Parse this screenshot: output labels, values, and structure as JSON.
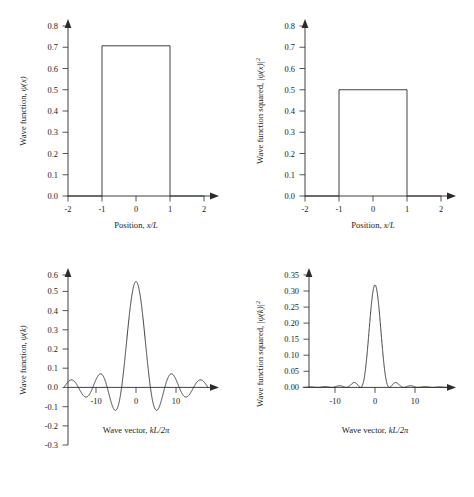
{
  "figure": {
    "panels": [
      {
        "id": "top-left",
        "name": "wave-function-position",
        "ylabel_plain": "Wave function, ",
        "ylabel_math": "ψ(x)",
        "ylabel_sup": "",
        "xlabel_plain": "Position, ",
        "xlabel_math": "x/L",
        "yticks": [
          "0.0",
          "0.1",
          "0.2",
          "0.3",
          "0.4",
          "0.5",
          "0.6",
          "0.7",
          "0.8"
        ],
        "xticks": [
          "-2",
          "-1",
          "0",
          "1",
          "2"
        ]
      },
      {
        "id": "top-right",
        "name": "wave-function-squared-position",
        "ylabel_plain": "Wave function squared, ",
        "ylabel_math": "|ψ(x)|",
        "ylabel_sup": "2",
        "xlabel_plain": "Position, ",
        "xlabel_math": "x/L",
        "yticks": [
          "0.0",
          "0.1",
          "0.2",
          "0.3",
          "0.4",
          "0.5",
          "0.6",
          "0.7",
          "0.8"
        ],
        "xticks": [
          "-2",
          "-1",
          "0",
          "1",
          "2"
        ]
      },
      {
        "id": "bottom-left",
        "name": "wave-function-wavevector",
        "ylabel_plain": "Wave function, ",
        "ylabel_math": "ψ(k)",
        "ylabel_sup": "",
        "xlabel_plain": "Wave vector, ",
        "xlabel_math": "kL/2π",
        "yticks": [
          "-0.3",
          "-0.2",
          "-0.1",
          "0.0",
          "0.1",
          "0.2",
          "0.3",
          "0.4",
          "0.5",
          "0.6"
        ],
        "xticks": [
          "-10",
          "0",
          "10"
        ]
      },
      {
        "id": "bottom-right",
        "name": "wave-function-squared-wavevector",
        "ylabel_plain": "Wave function squared, ",
        "ylabel_math": "|ψ(k)|",
        "ylabel_sup": "2",
        "xlabel_plain": "Wave vector, ",
        "xlabel_math": "kL/2π",
        "yticks": [
          "0.00",
          "0.05",
          "0.10",
          "0.15",
          "0.20",
          "0.25",
          "0.30",
          "0.35"
        ],
        "xticks": [
          "-10",
          "0",
          "10"
        ]
      }
    ]
  },
  "chart_data": [
    {
      "type": "line",
      "id": "top-left",
      "title": "",
      "xlabel": "Position, x/L",
      "ylabel": "Wave function, ψ(x)",
      "xlim": [
        -2,
        2
      ],
      "ylim": [
        0.0,
        0.8
      ],
      "xticks": [
        -2,
        -1,
        0,
        1,
        2
      ],
      "yticks": [
        0.0,
        0.1,
        0.2,
        0.3,
        0.4,
        0.5,
        0.6,
        0.7,
        0.8
      ],
      "grid": false,
      "legend": null,
      "description": "Rectangular top-hat wave function of amplitude 1/sqrt(2) between x/L = -1 and x/L = 1, zero elsewhere",
      "amplitude": 0.707,
      "edges": [
        -1,
        1
      ],
      "x": [
        -2,
        -1,
        -1,
        1,
        1,
        2
      ],
      "y": [
        0,
        0,
        0.707,
        0.707,
        0,
        0
      ]
    },
    {
      "type": "line",
      "id": "top-right",
      "title": "",
      "xlabel": "Position, x/L",
      "ylabel": "Wave function squared, |ψ(x)|²",
      "xlim": [
        -2,
        2
      ],
      "ylim": [
        0.0,
        0.8
      ],
      "xticks": [
        -2,
        -1,
        0,
        1,
        2
      ],
      "yticks": [
        0.0,
        0.1,
        0.2,
        0.3,
        0.4,
        0.5,
        0.6,
        0.7,
        0.8
      ],
      "grid": false,
      "legend": null,
      "description": "Square of the top-hat: constant probability density 0.5 between x/L = -1 and x/L = 1",
      "amplitude": 0.5,
      "edges": [
        -1,
        1
      ],
      "x": [
        -2,
        -1,
        -1,
        1,
        1,
        2
      ],
      "y": [
        0,
        0,
        0.5,
        0.5,
        0,
        0
      ]
    },
    {
      "type": "line",
      "id": "bottom-left",
      "title": "",
      "xlabel": "Wave vector, kL/2π",
      "ylabel": "Wave function, ψ(k)",
      "xlim": [
        -18,
        18
      ],
      "ylim": [
        -0.3,
        0.6
      ],
      "xticks": [
        -10,
        0,
        10
      ],
      "yticks": [
        -0.3,
        -0.2,
        -0.1,
        0.0,
        0.1,
        0.2,
        0.3,
        0.4,
        0.5,
        0.6
      ],
      "grid": false,
      "legend": null,
      "description": "Sinc function: Fourier transform of the top-hat. Central peak 0.565 at k=0, zero crossings every 3.6 units, decaying side lobes",
      "peak": 0.565,
      "zero_spacing": 3.6,
      "sidelobe_extrema": [
        0.121,
        -0.075,
        0.054,
        -0.042
      ],
      "formula": "0.565*sinc(x/3.6)"
    },
    {
      "type": "line",
      "id": "bottom-right",
      "title": "",
      "xlabel": "Wave vector, kL/2π",
      "ylabel": "Wave function squared, |ψ(k)|²",
      "xlim": [
        -18,
        18
      ],
      "ylim": [
        0.0,
        0.35
      ],
      "xticks": [
        -10,
        0,
        10
      ],
      "yticks": [
        0.0,
        0.05,
        0.1,
        0.15,
        0.2,
        0.25,
        0.3,
        0.35
      ],
      "grid": false,
      "legend": null,
      "description": "Squared sinc function: central peak 0.319 at k=0, small decaying side lobes below 0.03",
      "peak": 0.319,
      "zero_spacing": 3.6,
      "sidelobe_maxima": [
        0.0245,
        0.0088,
        0.0045,
        0.0028
      ],
      "formula": "0.319*sinc(x/3.6)^2"
    }
  ]
}
